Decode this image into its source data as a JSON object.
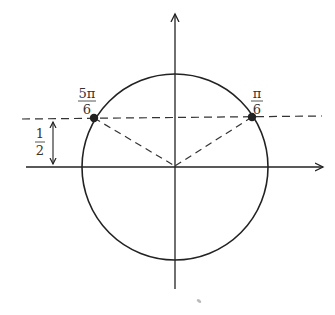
{
  "diagram": {
    "type": "unit-circle",
    "colors": {
      "stroke": "#222222",
      "dash": "#333333",
      "label": "#333333",
      "point": "#222222",
      "background": "#ffffff"
    },
    "points": [
      {
        "id": "pi-over-6",
        "label_num": "π",
        "label_den": "6",
        "angle": "π/6"
      },
      {
        "id": "5pi-over-6",
        "label_num": "5π",
        "label_den": "6",
        "angle": "5π/6"
      }
    ],
    "height_marker": {
      "label_num": "1",
      "label_den": "2",
      "value": "1/2"
    }
  }
}
